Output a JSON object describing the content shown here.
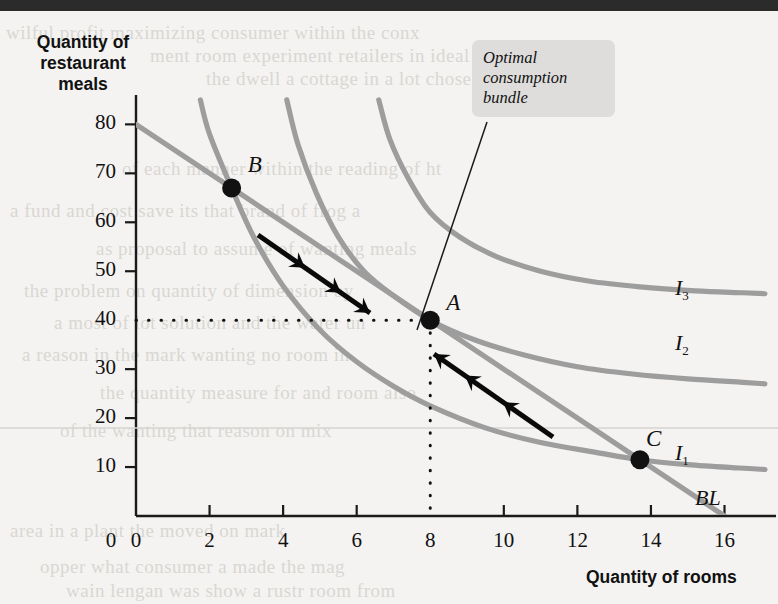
{
  "figure": {
    "y_axis_title": "Quantity of\nrestaurant\nmeals",
    "y_axis_title_lines": [
      "Quantity of",
      "restaurant",
      "meals"
    ],
    "x_axis_title": "Quantity of rooms",
    "callout": "Optimal consumption bundle",
    "callout_lines": [
      "Optimal",
      "consumption",
      "bundle"
    ],
    "origin_label": "0"
  },
  "chart_data": {
    "type": "line",
    "title": "",
    "xlabel": "Quantity of rooms",
    "ylabel": "Quantity of restaurant meals",
    "xlim": [
      0,
      17.4
    ],
    "ylim": [
      0,
      86
    ],
    "x_ticks": [
      0,
      2,
      4,
      6,
      8,
      10,
      12,
      14,
      16
    ],
    "y_ticks": [
      10,
      20,
      30,
      40,
      50,
      60,
      70,
      80
    ],
    "grid": false,
    "legend": "inline-curve-labels",
    "curve_color": "#9d9d9d",
    "marker_color": "#111111",
    "arrow_color": "#0a0a0a",
    "series": [
      {
        "name": "BL",
        "label": "BL",
        "type": "budget-line",
        "points": [
          [
            0,
            80
          ],
          [
            16,
            0
          ]
        ],
        "note": "straight budget line from 80 meals to 16 rooms"
      },
      {
        "name": "I1",
        "label": "I₁",
        "type": "indifference-curve",
        "points": [
          [
            1.75,
            85
          ],
          [
            2.0,
            78
          ],
          [
            2.6,
            67
          ],
          [
            3.2,
            57
          ],
          [
            4.0,
            47
          ],
          [
            5.0,
            38
          ],
          [
            6.0,
            31.5
          ],
          [
            7.0,
            26.5
          ],
          [
            8.0,
            22.5
          ],
          [
            9.5,
            18.0
          ],
          [
            11.0,
            15.0
          ],
          [
            12.5,
            13.0
          ],
          [
            13.7,
            11.5
          ],
          [
            15.0,
            10.5
          ],
          [
            16.4,
            9.8
          ],
          [
            17.1,
            9.5
          ]
        ]
      },
      {
        "name": "I2",
        "label": "I₂",
        "type": "indifference-curve",
        "points": [
          [
            4.1,
            85
          ],
          [
            4.4,
            76
          ],
          [
            4.9,
            66
          ],
          [
            5.5,
            57
          ],
          [
            6.2,
            50
          ],
          [
            7.0,
            45
          ],
          [
            8.0,
            40
          ],
          [
            9.2,
            36
          ],
          [
            10.5,
            33
          ],
          [
            12.0,
            30.5
          ],
          [
            13.5,
            29
          ],
          [
            15.0,
            28
          ],
          [
            16.5,
            27.3
          ],
          [
            17.1,
            27.0
          ]
        ]
      },
      {
        "name": "I3",
        "label": "I₃",
        "type": "indifference-curve",
        "points": [
          [
            6.6,
            85
          ],
          [
            6.9,
            77
          ],
          [
            7.4,
            69
          ],
          [
            8.0,
            62
          ],
          [
            8.8,
            57
          ],
          [
            9.8,
            53
          ],
          [
            11.0,
            50
          ],
          [
            12.3,
            48
          ],
          [
            13.7,
            46.8
          ],
          [
            15.2,
            46.0
          ],
          [
            16.5,
            45.6
          ],
          [
            17.1,
            45.4
          ]
        ]
      }
    ],
    "points": [
      {
        "label": "A",
        "x": 8.0,
        "y": 40,
        "note": "optimal consumption bundle, tangency of BL and I2"
      },
      {
        "label": "B",
        "x": 2.6,
        "y": 67,
        "note": "on BL and I1"
      },
      {
        "label": "C",
        "x": 13.7,
        "y": 11.5,
        "note": "on BL and I1"
      }
    ],
    "annotations": [
      {
        "text": "Optimal consumption bundle",
        "points_to": "A"
      },
      {
        "text": "dotted guide lines from A to x=8 and y=40"
      },
      {
        "text": "arrow from B toward A along the budget line"
      },
      {
        "text": "arrow from C toward A along the budget line"
      }
    ]
  },
  "ghost_text": [
    {
      "t": "wilful profit maximizing consumer within the conx",
      "x": 6,
      "y": 22
    },
    {
      "t": "ment room experiment retailers in ideal within",
      "x": 150,
      "y": 45
    },
    {
      "t": "the dwell a cottage in a lot chosen unit",
      "x": 206,
      "y": 68
    },
    {
      "t": "of each manner within the reading of ht",
      "x": 122,
      "y": 158
    },
    {
      "t": "a fund and cost save its that brand of frog a",
      "x": 10,
      "y": 200
    },
    {
      "t": "as proposal to assume of wanting meals",
      "x": 96,
      "y": 238
    },
    {
      "t": "the problem on quantity of dimension by",
      "x": 24,
      "y": 280
    },
    {
      "t": "a most of lot solution and the water un",
      "x": 54,
      "y": 312
    },
    {
      "t": "a reason in the mark wanting no room in",
      "x": 22,
      "y": 344
    },
    {
      "t": "the quantity measure for and room also",
      "x": 100,
      "y": 382
    },
    {
      "t": "of the wanting that reason on mix",
      "x": 60,
      "y": 420
    },
    {
      "t": "area in a plant the moved on mark",
      "x": 10,
      "y": 520
    },
    {
      "t": "opper what consumer a made the mag",
      "x": 40,
      "y": 556
    },
    {
      "t": "wain lengan was show a rustr room from",
      "x": 66,
      "y": 580
    }
  ]
}
